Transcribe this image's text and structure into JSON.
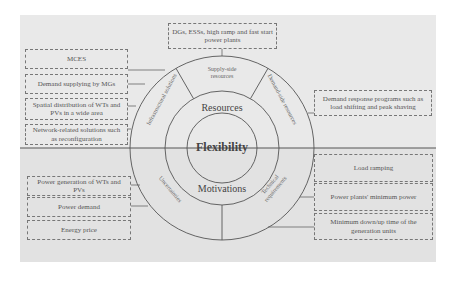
{
  "diagram": {
    "center_label": "Flexibility",
    "upper_half": {
      "title": "Resources",
      "segments": [
        {
          "label": "Infrastructural solutions"
        },
        {
          "label": "Supply-side resources"
        },
        {
          "label": "Demand-side resources"
        }
      ]
    },
    "lower_half": {
      "title": "Motivations",
      "segments": [
        {
          "label": "Uncertainties"
        },
        {
          "label": "Technical requirements"
        }
      ]
    },
    "boxes": {
      "supply_side": "DGs, ESSs, high ramp and fast start power plants",
      "infrastructural": [
        "MCES",
        "Demand supplying by MGs",
        "Spatial distribution of WTs and PVs in a wide area",
        "Network-related solutions such as reconfiguration"
      ],
      "demand_side": "Demand response programs such as load shifting and peak shaving",
      "uncertainties": [
        "Power generation of WTs and PVs",
        "Power demand",
        "Energy price"
      ],
      "technical": [
        "Load ramping",
        "Power plants' minimum power",
        "Minimum down/up time of the generation units"
      ]
    },
    "colors": {
      "upper_background": "#e9e9e9",
      "lower_background": "#e2e2e2",
      "line": "#555555",
      "dashed_border": "#777777"
    }
  }
}
